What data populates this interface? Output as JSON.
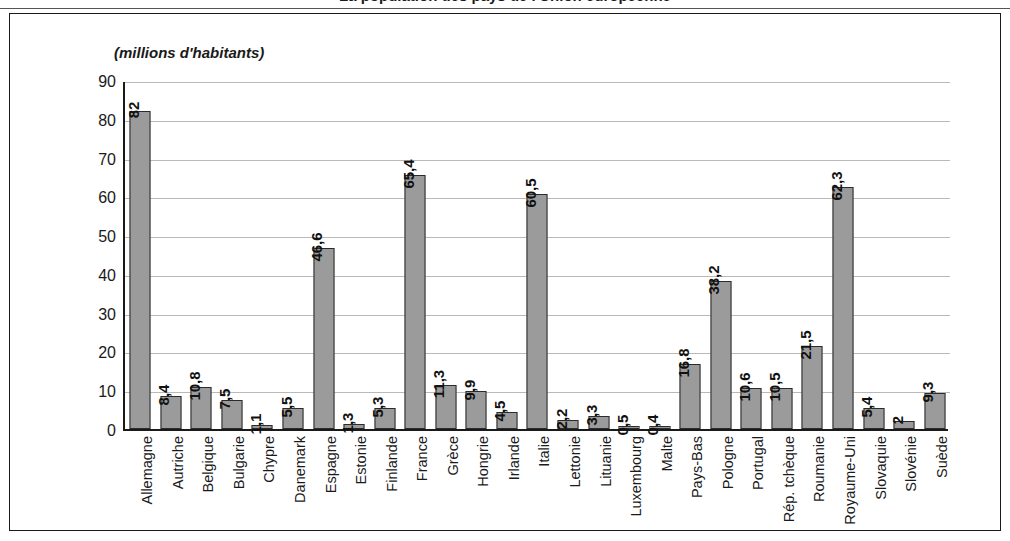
{
  "figure": {
    "title": "La population des pays de l'Union européenne",
    "axis_caption": "(millions d'habitants)",
    "bar_color": "#9b9b9b",
    "bar_border_color": "#2b2b2b",
    "gridline_color": "#b9b9b9",
    "axis_color": "#1a1a1a"
  },
  "chart_data": {
    "type": "bar",
    "title": "La population des pays de l'Union européenne",
    "xlabel": "",
    "ylabel": "(millions d'habitants)",
    "ylim": [
      0,
      90
    ],
    "yticks": [
      0,
      10,
      20,
      30,
      40,
      50,
      60,
      70,
      80,
      90
    ],
    "ytick_labels": [
      "0",
      "10",
      "20",
      "30",
      "40",
      "50",
      "60",
      "70",
      "80",
      "90"
    ],
    "grid": true,
    "legend": false,
    "decimal_separator": ",",
    "categories": [
      "Allemagne",
      "Autriche",
      "Belgique",
      "Bulgarie",
      "Chypre",
      "Danemark",
      "Espagne",
      "Estonie",
      "Finlande",
      "France",
      "Grèce",
      "Hongrie",
      "Irlande",
      "Italie",
      "Lettonie",
      "Lituanie",
      "Luxembourg",
      "Malte",
      "Pays-Bas",
      "Pologne",
      "Portugal",
      "Rép. tchèque",
      "Roumanie",
      "Royaume-Uni",
      "Slovaquie",
      "Slovénie",
      "Suède"
    ],
    "values": [
      82,
      8.4,
      10.8,
      7.5,
      1.1,
      5.5,
      46.6,
      1.3,
      5.3,
      65.4,
      11.3,
      9.9,
      4.5,
      60.5,
      2.2,
      3.3,
      0.5,
      0.4,
      16.8,
      38.2,
      10.6,
      10.5,
      21.5,
      62.3,
      5.4,
      2,
      9.3
    ],
    "value_labels": [
      "82",
      "8,4",
      "10,8",
      "7,5",
      "1,1",
      "5,5",
      "46,6",
      "1,3",
      "5,3",
      "65,4",
      "11,3",
      "9,9",
      "4,5",
      "60,5",
      "2,2",
      "3,3",
      "0,5",
      "0,4",
      "16,8",
      "38,2",
      "10,6",
      "10,5",
      "21,5",
      "62,3",
      "5,4",
      "2",
      "9,3"
    ]
  }
}
